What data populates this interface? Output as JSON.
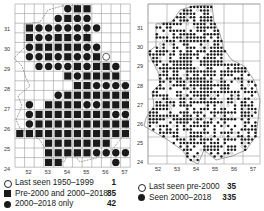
{
  "left_map": {
    "y_labels": [
      "31",
      "30",
      "29",
      "28",
      "27",
      "26",
      "25",
      "24"
    ],
    "x_labels": [
      "52",
      "53",
      "54",
      "55",
      "56",
      "57"
    ],
    "grid": {
      "x0": 15,
      "y0": 4,
      "cols": 12,
      "rows": 17,
      "cell": 9.6
    },
    "cells": [
      {
        "r": 0,
        "c": 5,
        "t": "D"
      },
      {
        "r": 0,
        "c": 6,
        "t": "S"
      },
      {
        "r": 0,
        "c": 7,
        "t": "S"
      },
      {
        "r": 1,
        "c": 4,
        "t": "D"
      },
      {
        "r": 1,
        "c": 5,
        "t": "S"
      },
      {
        "r": 1,
        "c": 6,
        "t": "D"
      },
      {
        "r": 1,
        "c": 7,
        "t": "D"
      },
      {
        "r": 2,
        "c": 1,
        "t": "S"
      },
      {
        "r": 2,
        "c": 2,
        "t": "D"
      },
      {
        "r": 2,
        "c": 3,
        "t": "D"
      },
      {
        "r": 2,
        "c": 4,
        "t": "D"
      },
      {
        "r": 2,
        "c": 5,
        "t": "D"
      },
      {
        "r": 2,
        "c": 6,
        "t": "D"
      },
      {
        "r": 2,
        "c": 7,
        "t": "D"
      },
      {
        "r": 2,
        "c": 8,
        "t": "D"
      },
      {
        "r": 3,
        "c": 1,
        "t": "S"
      },
      {
        "r": 3,
        "c": 2,
        "t": "D"
      },
      {
        "r": 3,
        "c": 3,
        "t": "D"
      },
      {
        "r": 3,
        "c": 4,
        "t": "S"
      },
      {
        "r": 3,
        "c": 5,
        "t": "S"
      },
      {
        "r": 3,
        "c": 6,
        "t": "D"
      },
      {
        "r": 3,
        "c": 7,
        "t": "S"
      },
      {
        "r": 4,
        "c": 1,
        "t": "D"
      },
      {
        "r": 4,
        "c": 2,
        "t": "S"
      },
      {
        "r": 4,
        "c": 3,
        "t": "S"
      },
      {
        "r": 4,
        "c": 4,
        "t": "S"
      },
      {
        "r": 4,
        "c": 5,
        "t": "S"
      },
      {
        "r": 4,
        "c": 6,
        "t": "S"
      },
      {
        "r": 4,
        "c": 7,
        "t": "D"
      },
      {
        "r": 4,
        "c": 8,
        "t": "D"
      },
      {
        "r": 5,
        "c": 1,
        "t": "D"
      },
      {
        "r": 5,
        "c": 2,
        "t": "D"
      },
      {
        "r": 5,
        "c": 3,
        "t": "S"
      },
      {
        "r": 5,
        "c": 4,
        "t": "D"
      },
      {
        "r": 5,
        "c": 5,
        "t": "S"
      },
      {
        "r": 5,
        "c": 6,
        "t": "D"
      },
      {
        "r": 5,
        "c": 7,
        "t": "D"
      },
      {
        "r": 5,
        "c": 8,
        "t": "S"
      },
      {
        "r": 5,
        "c": 9,
        "t": "O"
      },
      {
        "r": 6,
        "c": 2,
        "t": "D"
      },
      {
        "r": 6,
        "c": 3,
        "t": "D"
      },
      {
        "r": 6,
        "c": 4,
        "t": "D"
      },
      {
        "r": 6,
        "c": 5,
        "t": "D"
      },
      {
        "r": 6,
        "c": 6,
        "t": "S"
      },
      {
        "r": 6,
        "c": 7,
        "t": "D"
      },
      {
        "r": 6,
        "c": 8,
        "t": "S"
      },
      {
        "r": 6,
        "c": 9,
        "t": "S"
      },
      {
        "r": 6,
        "c": 10,
        "t": "D"
      },
      {
        "r": 7,
        "c": 5,
        "t": "S"
      },
      {
        "r": 7,
        "c": 6,
        "t": "D"
      },
      {
        "r": 7,
        "c": 7,
        "t": "S"
      },
      {
        "r": 7,
        "c": 8,
        "t": "S"
      },
      {
        "r": 7,
        "c": 9,
        "t": "S"
      },
      {
        "r": 7,
        "c": 10,
        "t": "S"
      },
      {
        "r": 8,
        "c": 6,
        "t": "S"
      },
      {
        "r": 8,
        "c": 7,
        "t": "S"
      },
      {
        "r": 8,
        "c": 8,
        "t": "D"
      },
      {
        "r": 8,
        "c": 9,
        "t": "D"
      },
      {
        "r": 8,
        "c": 10,
        "t": "D"
      },
      {
        "r": 8,
        "c": 11,
        "t": "D"
      },
      {
        "r": 9,
        "c": 4,
        "t": "D"
      },
      {
        "r": 9,
        "c": 5,
        "t": "S"
      },
      {
        "r": 9,
        "c": 6,
        "t": "S"
      },
      {
        "r": 9,
        "c": 7,
        "t": "S"
      },
      {
        "r": 9,
        "c": 8,
        "t": "S"
      },
      {
        "r": 9,
        "c": 9,
        "t": "S"
      },
      {
        "r": 9,
        "c": 10,
        "t": "S"
      },
      {
        "r": 9,
        "c": 11,
        "t": "S"
      },
      {
        "r": 10,
        "c": 1,
        "t": "D"
      },
      {
        "r": 10,
        "c": 3,
        "t": "S"
      },
      {
        "r": 10,
        "c": 4,
        "t": "S"
      },
      {
        "r": 10,
        "c": 5,
        "t": "S"
      },
      {
        "r": 10,
        "c": 6,
        "t": "S"
      },
      {
        "r": 10,
        "c": 7,
        "t": "D"
      },
      {
        "r": 10,
        "c": 8,
        "t": "D"
      },
      {
        "r": 10,
        "c": 9,
        "t": "S"
      },
      {
        "r": 10,
        "c": 10,
        "t": "S"
      },
      {
        "r": 10,
        "c": 11,
        "t": "S"
      },
      {
        "r": 11,
        "c": 1,
        "t": "D"
      },
      {
        "r": 11,
        "c": 2,
        "t": "S"
      },
      {
        "r": 11,
        "c": 3,
        "t": "S"
      },
      {
        "r": 11,
        "c": 4,
        "t": "S"
      },
      {
        "r": 11,
        "c": 5,
        "t": "S"
      },
      {
        "r": 11,
        "c": 6,
        "t": "S"
      },
      {
        "r": 11,
        "c": 7,
        "t": "S"
      },
      {
        "r": 11,
        "c": 8,
        "t": "S"
      },
      {
        "r": 11,
        "c": 9,
        "t": "S"
      },
      {
        "r": 11,
        "c": 10,
        "t": "D"
      },
      {
        "r": 11,
        "c": 11,
        "t": "D"
      },
      {
        "r": 12,
        "c": 1,
        "t": "D"
      },
      {
        "r": 12,
        "c": 2,
        "t": "S"
      },
      {
        "r": 12,
        "c": 3,
        "t": "S"
      },
      {
        "r": 12,
        "c": 4,
        "t": "S"
      },
      {
        "r": 12,
        "c": 5,
        "t": "S"
      },
      {
        "r": 12,
        "c": 6,
        "t": "S"
      },
      {
        "r": 12,
        "c": 7,
        "t": "S"
      },
      {
        "r": 12,
        "c": 8,
        "t": "S"
      },
      {
        "r": 12,
        "c": 9,
        "t": "S"
      },
      {
        "r": 12,
        "c": 10,
        "t": "S"
      },
      {
        "r": 12,
        "c": 11,
        "t": "S"
      },
      {
        "r": 13,
        "c": 0,
        "t": "S"
      },
      {
        "r": 13,
        "c": 1,
        "t": "S"
      },
      {
        "r": 13,
        "c": 2,
        "t": "S"
      },
      {
        "r": 13,
        "c": 3,
        "t": "S"
      },
      {
        "r": 13,
        "c": 4,
        "t": "S"
      },
      {
        "r": 13,
        "c": 5,
        "t": "S"
      },
      {
        "r": 13,
        "c": 6,
        "t": "S"
      },
      {
        "r": 13,
        "c": 7,
        "t": "S"
      },
      {
        "r": 13,
        "c": 8,
        "t": "S"
      },
      {
        "r": 13,
        "c": 9,
        "t": "S"
      },
      {
        "r": 13,
        "c": 10,
        "t": "S"
      },
      {
        "r": 13,
        "c": 11,
        "t": "S"
      },
      {
        "r": 14,
        "c": 3,
        "t": "S"
      },
      {
        "r": 14,
        "c": 4,
        "t": "S"
      },
      {
        "r": 14,
        "c": 5,
        "t": "S"
      },
      {
        "r": 14,
        "c": 6,
        "t": "S"
      },
      {
        "r": 14,
        "c": 7,
        "t": "S"
      },
      {
        "r": 14,
        "c": 8,
        "t": "S"
      },
      {
        "r": 14,
        "c": 9,
        "t": "S"
      },
      {
        "r": 15,
        "c": 3,
        "t": "S"
      },
      {
        "r": 15,
        "c": 4,
        "t": "S"
      },
      {
        "r": 15,
        "c": 5,
        "t": "S"
      },
      {
        "r": 15,
        "c": 6,
        "t": "S"
      },
      {
        "r": 15,
        "c": 7,
        "t": "S"
      },
      {
        "r": 15,
        "c": 8,
        "t": "D"
      },
      {
        "r": 15,
        "c": 9,
        "t": "D"
      },
      {
        "r": 15,
        "c": 10,
        "t": "D"
      },
      {
        "r": 15,
        "c": 11,
        "t": "D"
      },
      {
        "r": 16,
        "c": 3,
        "t": "S"
      },
      {
        "r": 16,
        "c": 4,
        "t": "S"
      },
      {
        "r": 16,
        "c": 10,
        "t": "D"
      }
    ],
    "legend": [
      {
        "symbol": "open-circle",
        "label": "Last seen 1950–1999",
        "count": "1"
      },
      {
        "symbol": "square",
        "label": "Pre-2000 and 2000–2018",
        "count": "85"
      },
      {
        "symbol": "dot",
        "label": "2000–2018 only",
        "count": "42"
      }
    ]
  },
  "right_map": {
    "y_labels": [
      "31",
      "30",
      "29",
      "28",
      "27",
      "26",
      "25",
      "24"
    ],
    "x_labels": [
      "52",
      "53",
      "54",
      "55",
      "56",
      "57"
    ],
    "legend": [
      {
        "symbol": "open-circle",
        "label": "Last seen pre-2000",
        "count": "35"
      },
      {
        "symbol": "dot",
        "label": "Seen 2000–2018",
        "count": "335"
      }
    ]
  },
  "colors": {
    "ink": "#1a1a1a",
    "grid": "#9a9a9a",
    "outline": "#8a8a8a",
    "background": "#ffffff"
  }
}
